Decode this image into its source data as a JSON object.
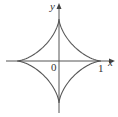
{
  "figure": {
    "type": "astroid",
    "equation": "x^(2/3) + y^(2/3) = 1",
    "labels": {
      "y_axis": "y",
      "x_axis": "x",
      "origin": "0",
      "x_tick": "1"
    },
    "colors": {
      "curve": "#555555",
      "axes": "#555555",
      "text": "#333333"
    }
  }
}
